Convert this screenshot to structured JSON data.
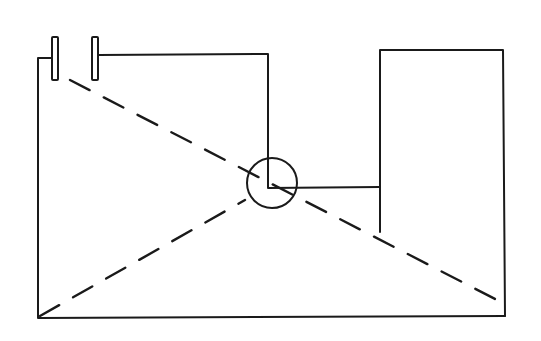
{
  "diagram": {
    "type": "line-schematic",
    "colors": {
      "line": "#1a1a1a",
      "background": "#ffffff"
    },
    "elements": {
      "plates": [
        {
          "id": "left-plate",
          "x": 52,
          "y": 37,
          "w": 6,
          "h": 43
        },
        {
          "id": "right-plate",
          "x": 92,
          "y": 37,
          "w": 6,
          "h": 43
        }
      ],
      "circle": {
        "cx": 272,
        "cy": 183,
        "r": 25
      },
      "right_box": {
        "x": 378,
        "y": 50,
        "w": 127,
        "h": 266
      },
      "dashed_lines": [
        {
          "x1": 70,
          "y1": 80,
          "x2": 497,
          "y2": 300
        },
        {
          "x1": 40,
          "y1": 316,
          "x2": 245,
          "y2": 200
        }
      ]
    },
    "labels": []
  }
}
